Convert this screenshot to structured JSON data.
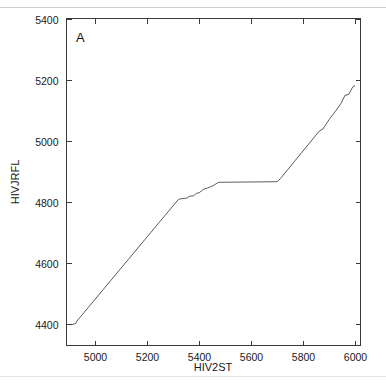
{
  "figure": {
    "panel_label": "A"
  },
  "chart_data": {
    "type": "line",
    "title": "",
    "subtitle": "",
    "panel": "A",
    "xlabel": "HIV2ST",
    "ylabel": "HIVJRFL",
    "xlim": [
      4890,
      6020
    ],
    "ylim": [
      4330,
      5400
    ],
    "xticks": [
      5000,
      5200,
      5400,
      5600,
      5800,
      6000
    ],
    "yticks": [
      4400,
      4600,
      4800,
      5000,
      5200,
      5400
    ],
    "xtick_labels": [
      "5000",
      "5200",
      "5400",
      "5600",
      "5800",
      "6000"
    ],
    "ytick_labels": [
      "4400",
      "4600",
      "4800",
      "5000",
      "5200",
      "5400"
    ],
    "grid": false,
    "legend": "none",
    "tick_direction": "in",
    "box": true,
    "series": [
      {
        "name": "alignment path",
        "x": [
          4908,
          4925,
          4930,
          5320,
          5330,
          5352,
          5362,
          5378,
          5390,
          5400,
          5418,
          5428,
          5445,
          5452,
          5470,
          5478,
          5700,
          5712,
          5862,
          5875,
          5900,
          5925,
          5945,
          5960,
          5975,
          5990,
          5998
        ],
        "y": [
          4398,
          4402,
          4410,
          4808,
          4810,
          4812,
          4818,
          4820,
          4828,
          4830,
          4842,
          4844,
          4850,
          4852,
          4862,
          4864,
          4866,
          4876,
          5032,
          5038,
          5070,
          5098,
          5122,
          5148,
          5152,
          5176,
          5180
        ]
      }
    ]
  }
}
